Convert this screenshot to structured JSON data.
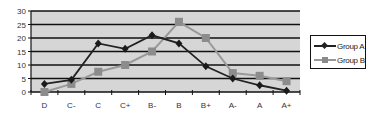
{
  "chart_data": {
    "type": "line",
    "title": "",
    "xlabel": "",
    "ylabel": "",
    "categories": [
      "D",
      "C-",
      "C",
      "C+",
      "B-",
      "B",
      "B+",
      "A-",
      "A",
      "A+"
    ],
    "series": [
      {
        "name": "Group A",
        "color": "#222222",
        "marker": "diamond",
        "values": [
          3,
          4.5,
          18,
          16,
          21,
          18,
          9.5,
          5,
          2.5,
          0.5
        ]
      },
      {
        "name": "Group B",
        "color": "#999999",
        "marker": "square",
        "values": [
          0,
          3,
          7.5,
          10,
          15,
          26,
          20,
          7,
          6,
          4
        ]
      }
    ],
    "ylim": [
      0,
      30
    ],
    "yticks": [
      0,
      5,
      10,
      15,
      20,
      25,
      30
    ],
    "grid": true,
    "legend_position": "right",
    "plot_background": "#d4d4d4"
  },
  "legend": {
    "items": [
      {
        "label": "Group A"
      },
      {
        "label": "Group B"
      }
    ]
  }
}
